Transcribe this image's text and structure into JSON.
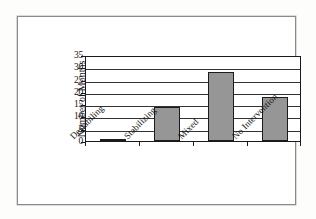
{
  "figure": {
    "frame_border_color": "#8a8a8a",
    "background_color": "#ffffff"
  },
  "chart_data": {
    "type": "bar",
    "title": "",
    "subtitle": "",
    "xlabel": "",
    "ylabel": "Number of Months",
    "categories": [
      "Destabiling",
      "Stabilizing",
      "Mixed",
      "No Intervention"
    ],
    "values": [
      1,
      14,
      28,
      18
    ],
    "series": [
      {
        "name": "Number of Months",
        "values": [
          1,
          14,
          28,
          18
        ]
      }
    ],
    "ylim": [
      0,
      35
    ],
    "yticks": [
      0,
      5,
      10,
      15,
      20,
      25,
      30,
      35
    ],
    "ytick_labels": [
      "0",
      "5",
      "10",
      "15",
      "20",
      "25",
      "30",
      "35"
    ],
    "grid": true,
    "grid_axis": "y",
    "legend": false,
    "legend_position": "none",
    "bar_fill_color": "#969696",
    "bar_edge_color": "#1c1c1c",
    "gridline_color": "#333333",
    "axis_color": "#1a1a1a",
    "annotations": []
  }
}
